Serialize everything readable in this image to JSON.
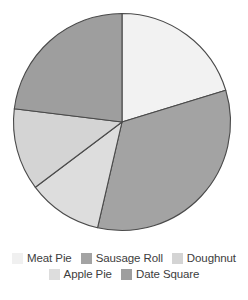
{
  "chart_data": {
    "type": "pie",
    "title": "",
    "subtitle": "",
    "xlabel": "",
    "ylabel": "",
    "legend_position": "bottom",
    "grid": false,
    "start_angle_deg": 0,
    "direction": "clockwise",
    "categories": [
      "Meat Pie",
      "Sausage Roll",
      "Doughnut",
      "Apple Pie",
      "Date Square"
    ],
    "values": [
      20.3,
      33.3,
      12.2,
      11.1,
      23.1
    ],
    "slices": [
      {
        "label": "Meat Pie",
        "value": 20.3,
        "start_deg": 0,
        "end_deg": 73,
        "sweep_deg": 73,
        "color": "#f2f2f2"
      },
      {
        "label": "Sausage Roll",
        "value": 33.3,
        "start_deg": 73,
        "end_deg": 193,
        "sweep_deg": 120,
        "color": "#a3a3a3"
      },
      {
        "label": "Apple Pie",
        "value": 11.1,
        "start_deg": 193,
        "end_deg": 233,
        "sweep_deg": 40,
        "color": "#dddddd"
      },
      {
        "label": "Doughnut",
        "value": 12.2,
        "start_deg": 233,
        "end_deg": 277,
        "sweep_deg": 44,
        "color": "#d4d4d4"
      },
      {
        "label": "Date Square",
        "value": 23.1,
        "start_deg": 277,
        "end_deg": 360,
        "sweep_deg": 83,
        "color": "#9e9e9e"
      }
    ],
    "outline_color": "#4a4a4a"
  },
  "legend": {
    "rows": [
      [
        {
          "label": "Meat Pie",
          "color": "#f0f0f0"
        },
        {
          "label": "Sausage Roll",
          "color": "#a3a3a3"
        },
        {
          "label": "Doughnut",
          "color": "#d4d4d4"
        }
      ],
      [
        {
          "label": "Apple Pie",
          "color": "#dddddd"
        },
        {
          "label": "Date Square",
          "color": "#9e9e9e"
        }
      ]
    ]
  }
}
